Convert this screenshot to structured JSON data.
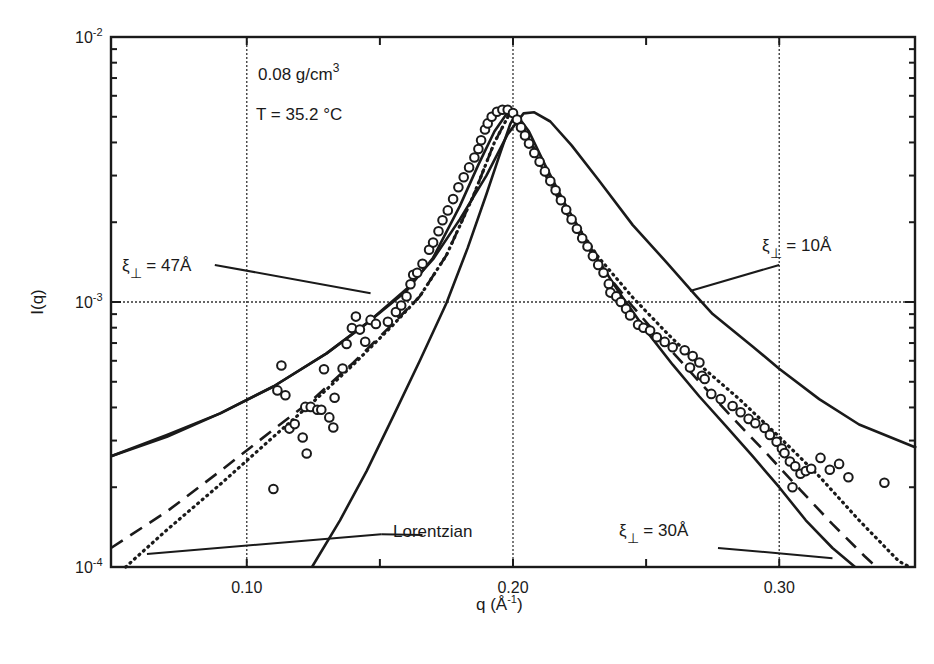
{
  "chart_data": {
    "type": "line",
    "title": "",
    "xlabel": "q (Å-1)",
    "xlabel_main": "q (Å",
    "xlabel_sup": "-1",
    "xlabel_close": ")",
    "ylabel": "I(q)",
    "xscale": "linear",
    "yscale": "log",
    "xlim": [
      0.049,
      0.351
    ],
    "ylim": [
      0.0001,
      0.01
    ],
    "x_ticks": [
      0.1,
      0.2,
      0.3
    ],
    "x_tick_labels": [
      "0.10",
      "0.20",
      "0.30"
    ],
    "x_minor_ticks": [
      0.15,
      0.25
    ],
    "y_ticks": [
      {
        "base": "10",
        "exp": "-2",
        "value": 0.01
      },
      {
        "base": "10",
        "exp": "-3",
        "value": 0.001
      },
      {
        "base": "10",
        "exp": "-4",
        "value": 0.0001
      }
    ],
    "grid": "dotted at major ticks",
    "annotations": {
      "density": {
        "main": "0.08 g/cm",
        "sup": "3"
      },
      "temperature": "T = 35.2 °C",
      "xi47": {
        "xi": "ξ",
        "sub": "⊥",
        "rest": " = 47Å"
      },
      "xi10": {
        "xi": "ξ",
        "sub": "⊥",
        "rest": " = 10Å"
      },
      "xi30": {
        "xi": "ξ",
        "sub": "⊥",
        "rest": " = 30Å"
      },
      "lorentzian": "Lorentzian"
    },
    "series": [
      {
        "name": "data",
        "style": "open-circles",
        "points": [
          [
            0.11,
            0.000197
          ],
          [
            0.1115,
            0.000464
          ],
          [
            0.113,
            0.000576
          ],
          [
            0.1145,
            0.000445
          ],
          [
            0.116,
            0.000333
          ],
          [
            0.118,
            0.000346
          ],
          [
            0.121,
            0.000308
          ],
          [
            0.122,
            0.000402
          ],
          [
            0.1225,
            0.000268
          ],
          [
            0.124,
            0.000402
          ],
          [
            0.1265,
            0.000392
          ],
          [
            0.129,
            0.000557
          ],
          [
            0.128,
            0.000392
          ],
          [
            0.131,
            0.000367
          ],
          [
            0.1325,
            0.000336
          ],
          [
            0.133,
            0.000435
          ],
          [
            0.136,
            0.000561
          ],
          [
            0.1375,
            0.000694
          ],
          [
            0.1395,
            0.000798
          ],
          [
            0.141,
            0.000881
          ],
          [
            0.1425,
            0.000787
          ],
          [
            0.1445,
            0.000708
          ],
          [
            0.1465,
            0.000856
          ],
          [
            0.1485,
            0.000827
          ],
          [
            0.153,
            0.000843
          ],
          [
            0.156,
            0.000917
          ],
          [
            0.158,
            0.00097
          ],
          [
            0.16,
            0.00105
          ],
          [
            0.1615,
            0.001167
          ],
          [
            0.1625,
            0.001267
          ],
          [
            0.164,
            0.00129
          ],
          [
            0.166,
            0.001395
          ],
          [
            0.1685,
            0.001574
          ],
          [
            0.17,
            0.001675
          ],
          [
            0.172,
            0.001848
          ],
          [
            0.1735,
            0.002033
          ],
          [
            0.1755,
            0.002217
          ],
          [
            0.1775,
            0.002445
          ],
          [
            0.1795,
            0.00271
          ],
          [
            0.1815,
            0.002955
          ],
          [
            0.1835,
            0.00322
          ],
          [
            0.1855,
            0.00351
          ],
          [
            0.187,
            0.00378
          ],
          [
            0.188,
            0.004075
          ],
          [
            0.1895,
            0.004475
          ],
          [
            0.1905,
            0.00472
          ],
          [
            0.192,
            0.005
          ],
          [
            0.194,
            0.00522
          ],
          [
            0.196,
            0.00531
          ],
          [
            0.198,
            0.00531
          ],
          [
            0.2,
            0.00516
          ],
          [
            0.2015,
            0.00488
          ],
          [
            0.203,
            0.00456
          ],
          [
            0.2045,
            0.00425
          ],
          [
            0.206,
            0.00396
          ],
          [
            0.208,
            0.00365
          ],
          [
            0.21,
            0.00338
          ],
          [
            0.212,
            0.00311
          ],
          [
            0.214,
            0.00286
          ],
          [
            0.216,
            0.00264
          ],
          [
            0.218,
            0.00242
          ],
          [
            0.22,
            0.00223
          ],
          [
            0.222,
            0.00205
          ],
          [
            0.224,
            0.00189
          ],
          [
            0.226,
            0.00174
          ],
          [
            0.228,
            0.00162
          ],
          [
            0.23,
            0.00149
          ],
          [
            0.232,
            0.00138
          ],
          [
            0.234,
            0.00129
          ],
          [
            0.236,
            0.00117
          ],
          [
            0.2366,
            0.001085
          ],
          [
            0.2388,
            0.00105
          ],
          [
            0.2405,
            0.001
          ],
          [
            0.2425,
            0.000943
          ],
          [
            0.244,
            0.00089
          ],
          [
            0.247,
            0.00082
          ],
          [
            0.249,
            0.0008
          ],
          [
            0.2515,
            0.00078
          ],
          [
            0.254,
            0.000736
          ],
          [
            0.257,
            0.000707
          ],
          [
            0.26,
            0.000675
          ],
          [
            0.2645,
            0.000657
          ],
          [
            0.2675,
            0.000625
          ],
          [
            0.27,
            0.000591
          ],
          [
            0.2665,
            0.000566
          ],
          [
            0.271,
            0.000527
          ],
          [
            0.272,
            0.000512
          ],
          [
            0.2745,
            0.00045
          ],
          [
            0.278,
            0.00043
          ],
          [
            0.2825,
            0.000405
          ],
          [
            0.2855,
            0.000384
          ],
          [
            0.2885,
            0.000362
          ],
          [
            0.291,
            0.000349
          ],
          [
            0.2945,
            0.000335
          ],
          [
            0.2965,
            0.000315
          ],
          [
            0.299,
            0.000297
          ],
          [
            0.301,
            0.00028
          ],
          [
            0.302,
            0.000269
          ],
          [
            0.304,
            0.00025
          ],
          [
            0.306,
            0.00024
          ],
          [
            0.308,
            0.000225
          ],
          [
            0.31,
            0.00023
          ],
          [
            0.305,
            0.0002
          ],
          [
            0.312,
            0.000235
          ],
          [
            0.3155,
            0.000258
          ],
          [
            0.319,
            0.000233
          ],
          [
            0.3225,
            0.000245
          ],
          [
            0.326,
            0.000218
          ],
          [
            0.3395,
            0.000208
          ]
        ]
      },
      {
        "name": "ξ⊥ = 47Å",
        "style": "solid",
        "points": [
          [
            0.049,
            0.000262
          ],
          [
            0.07,
            0.000315
          ],
          [
            0.09,
            0.00038
          ],
          [
            0.11,
            0.00048
          ],
          [
            0.13,
            0.00064
          ],
          [
            0.145,
            0.00083
          ],
          [
            0.16,
            0.0011
          ],
          [
            0.17,
            0.00147
          ],
          [
            0.18,
            0.0023
          ],
          [
            0.187,
            0.0033
          ],
          [
            0.193,
            0.0044
          ],
          [
            0.198,
            0.0052
          ],
          [
            0.201,
            0.00515
          ],
          [
            0.206,
            0.0044
          ],
          [
            0.212,
            0.0033
          ],
          [
            0.22,
            0.0023
          ],
          [
            0.23,
            0.00155
          ],
          [
            0.24,
            0.00108
          ],
          [
            0.25,
            0.00078
          ],
          [
            0.26,
            0.00058
          ],
          [
            0.27,
            0.00044
          ],
          [
            0.28,
            0.00034
          ],
          [
            0.29,
            0.000262
          ],
          [
            0.3,
            0.0002
          ],
          [
            0.31,
            0.00015
          ],
          [
            0.32,
            0.000118
          ],
          [
            0.3285,
            0.0001
          ]
        ]
      },
      {
        "name": "ξ⊥ = 10Å",
        "style": "solid",
        "points": [
          [
            0.049,
            0.000262
          ],
          [
            0.07,
            0.00031
          ],
          [
            0.09,
            0.00038
          ],
          [
            0.11,
            0.00048
          ],
          [
            0.13,
            0.00064
          ],
          [
            0.145,
            0.00083
          ],
          [
            0.16,
            0.00112
          ],
          [
            0.17,
            0.00145
          ],
          [
            0.18,
            0.00205
          ],
          [
            0.19,
            0.003
          ],
          [
            0.198,
            0.0043
          ],
          [
            0.204,
            0.00515
          ],
          [
            0.208,
            0.0052
          ],
          [
            0.214,
            0.0048
          ],
          [
            0.222,
            0.0039
          ],
          [
            0.232,
            0.0029
          ],
          [
            0.245,
            0.00195
          ],
          [
            0.258,
            0.0014
          ],
          [
            0.2686,
            0.00106
          ],
          [
            0.275,
            0.0009
          ],
          [
            0.29,
            0.00068
          ],
          [
            0.3,
            0.00056
          ],
          [
            0.315,
            0.00043
          ],
          [
            0.33,
            0.000345
          ],
          [
            0.3515,
            0.000282
          ]
        ]
      },
      {
        "name": "ξ⊥ = 30Å (narrow)",
        "style": "solid",
        "points": [
          [
            0.1245,
            0.0001
          ],
          [
            0.135,
            0.00015
          ],
          [
            0.145,
            0.00023
          ],
          [
            0.155,
            0.00037
          ],
          [
            0.165,
            0.0006
          ],
          [
            0.175,
            0.00099
          ],
          [
            0.183,
            0.0016
          ],
          [
            0.19,
            0.00255
          ],
          [
            0.195,
            0.0036
          ],
          [
            0.199,
            0.0047
          ],
          [
            0.201,
            0.0051
          ]
        ]
      },
      {
        "name": "Lorentzian",
        "style": "dashed",
        "points": [
          [
            0.049,
            0.000118
          ],
          [
            0.07,
            0.000162
          ],
          [
            0.09,
            0.00023
          ],
          [
            0.11,
            0.00033
          ],
          [
            0.125,
            0.00043
          ],
          [
            0.14,
            0.00059
          ],
          [
            0.155,
            0.00083
          ],
          [
            0.165,
            0.00105
          ],
          [
            0.175,
            0.0015
          ],
          [
            0.185,
            0.0025
          ],
          [
            0.193,
            0.004
          ],
          [
            0.199,
            0.0052
          ],
          [
            0.205,
            0.0043
          ],
          [
            0.213,
            0.0029
          ],
          [
            0.222,
            0.002
          ],
          [
            0.232,
            0.0014
          ],
          [
            0.245,
            0.00096
          ],
          [
            0.258,
            0.00068
          ],
          [
            0.27,
            0.0005
          ],
          [
            0.282,
            0.00037
          ],
          [
            0.295,
            0.00027
          ],
          [
            0.308,
            0.000195
          ],
          [
            0.32,
            0.000145
          ],
          [
            0.332,
            0.00011
          ],
          [
            0.3365,
            0.0001
          ]
        ]
      },
      {
        "name": "dotted fit",
        "style": "dotted",
        "points": [
          [
            0.0545,
            0.0001
          ],
          [
            0.07,
            0.000138
          ],
          [
            0.09,
            0.000205
          ],
          [
            0.11,
            0.00031
          ],
          [
            0.125,
            0.00042
          ],
          [
            0.14,
            0.00058
          ],
          [
            0.155,
            0.00082
          ],
          [
            0.165,
            0.00105
          ],
          [
            0.175,
            0.0015
          ],
          [
            0.185,
            0.0025
          ],
          [
            0.193,
            0.004
          ],
          [
            0.199,
            0.0052
          ],
          [
            0.205,
            0.00435
          ],
          [
            0.213,
            0.003
          ],
          [
            0.222,
            0.00208
          ],
          [
            0.232,
            0.00148
          ],
          [
            0.245,
            0.00104
          ],
          [
            0.258,
            0.00076
          ],
          [
            0.27,
            0.00058
          ],
          [
            0.285,
            0.00043
          ],
          [
            0.3,
            0.00031
          ],
          [
            0.315,
            0.00022
          ],
          [
            0.33,
            0.00015
          ],
          [
            0.345,
            0.000105
          ],
          [
            0.349,
            0.0001
          ]
        ]
      }
    ],
    "label_lines": [
      {
        "name": "xi47-pointer",
        "from": [
          0.088,
          0.00138
        ],
        "to": [
          0.1465,
          0.00108
        ]
      },
      {
        "name": "xi10-pointer",
        "from": [
          0.2665,
          0.0011
        ],
        "to": [
          0.3,
          0.00138
        ]
      },
      {
        "name": "xi30-pointer",
        "from": [
          0.277,
          0.000118
        ],
        "to": [
          0.32,
          0.000108
        ]
      },
      {
        "name": "lorentzian-pointer-a",
        "from": [
          0.0625,
          0.000112
        ],
        "to": [
          0.1505,
          0.000133
        ]
      },
      {
        "name": "lorentzian-pointer-b",
        "from": [
          0.1505,
          0.000133
        ],
        "to": [
          0.166,
          0.000132
        ]
      }
    ]
  }
}
